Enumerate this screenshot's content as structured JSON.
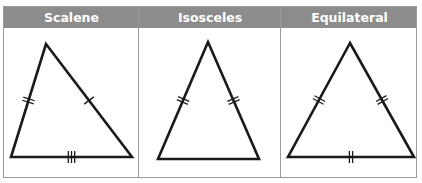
{
  "panels": [
    {
      "label": "Scalene",
      "triangle": {
        "apex": [
          46,
          44
        ],
        "left": [
          11,
          157
        ],
        "right": [
          132,
          157
        ]
      },
      "marks": {
        "left_side": 2,
        "right_side": 1,
        "base": 3
      }
    },
    {
      "label": "Isosceles",
      "triangle": {
        "apex": [
          208,
          42
        ],
        "left": [
          158,
          159
        ],
        "right": [
          259,
          159
        ]
      },
      "marks": {
        "left_side": 2,
        "right_side": 2,
        "base": 0
      }
    },
    {
      "label": "Equilateral",
      "triangle": {
        "apex": [
          350,
          43
        ],
        "left": [
          288,
          157
        ],
        "right": [
          414,
          157
        ]
      },
      "marks": {
        "left_side": 2,
        "right_side": 2,
        "base": 2
      }
    }
  ],
  "colors": {
    "header_bg": "#8c8c8c",
    "header_text": "#ffffff",
    "stroke": "#1a1a1a",
    "border": "#9a9a9a"
  }
}
